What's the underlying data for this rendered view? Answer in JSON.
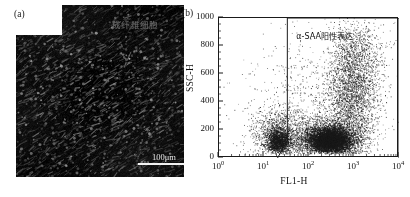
{
  "figure": {
    "panels": [
      {
        "id": "a",
        "label": "(a)",
        "type": "micrograph",
        "overlay_text": "成纤维细胞",
        "scalebar_text": "100μm"
      },
      {
        "id": "b",
        "label": "(b)",
        "type": "scatter"
      }
    ]
  },
  "chart_data": {
    "type": "scatter",
    "title": "",
    "xlabel": "FL1-H",
    "ylabel": "SSC-H",
    "xscale": "log",
    "yscale": "linear",
    "xlim": [
      1,
      10000
    ],
    "ylim": [
      0,
      1000
    ],
    "grid": false,
    "legend": "none",
    "xticklabels": [
      "10",
      "10",
      "10",
      "10",
      "10"
    ],
    "xtickexponents": [
      "0",
      "1",
      "2",
      "3",
      "4"
    ],
    "xtickvalues": [
      1,
      10,
      100,
      1000,
      10000
    ],
    "yticklabels": [
      "0",
      "200",
      "400",
      "600",
      "800",
      "1000"
    ],
    "ytickvalues": [
      0,
      200,
      400,
      600,
      800,
      1000
    ],
    "marker": "dot",
    "marker_color": "#1a1a1a",
    "point_count": 9000,
    "annotations": [
      {
        "name": "gate-region",
        "text": "α-SAA阳性表达",
        "shape": "polygon",
        "vertices_data": [
          [
            20,
            0
          ],
          [
            33,
            125
          ],
          [
            33,
            1000
          ],
          [
            10000,
            1000
          ],
          [
            10000,
            0
          ]
        ],
        "color": "#1a1a1a"
      }
    ],
    "clusters": [
      {
        "name": "negative-low-ssc",
        "x_center_log": 1.35,
        "y_center": 150,
        "x_spread_log": 0.3,
        "y_spread": 95,
        "n": 1500
      },
      {
        "name": "main-dense-positive",
        "x_center_log": 2.45,
        "y_center": 135,
        "x_spread_log": 0.36,
        "y_spread": 70,
        "n": 3400
      },
      {
        "name": "positive-high-ssc",
        "x_center_log": 2.95,
        "y_center": 420,
        "x_spread_log": 0.3,
        "y_spread": 190,
        "n": 2300
      },
      {
        "name": "upper-tail",
        "x_center_log": 3.05,
        "y_center": 720,
        "x_spread_log": 0.28,
        "y_spread": 150,
        "n": 900
      },
      {
        "name": "sparse-background",
        "x_center_log": 2.2,
        "y_center": 380,
        "x_spread_log": 0.85,
        "y_spread": 250,
        "n": 900
      }
    ]
  }
}
